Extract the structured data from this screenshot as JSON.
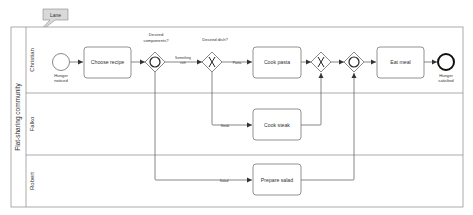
{
  "callout": {
    "label": "Lane"
  },
  "pool": {
    "label": "Flat-sharing community",
    "lanes": [
      {
        "label": "Christian"
      },
      {
        "label": "Falko"
      },
      {
        "label": "Robert"
      }
    ]
  },
  "events": {
    "start": {
      "label_line1": "Hunger",
      "label_line2": "noticed"
    },
    "end": {
      "label_line1": "Hunger",
      "label_line2": "satisfied"
    }
  },
  "tasks": {
    "choose_recipe": "Choose recipe",
    "cook_pasta": "Cook pasta",
    "cook_steak": "Cook steak",
    "prepare_salad": "Prepare salad",
    "eat_meal": "Eat meal"
  },
  "gateways": {
    "desired_components": {
      "type": "inclusive",
      "label_line1": "Desired",
      "label_line2": "components?"
    },
    "desired_dish": {
      "type": "exclusive",
      "label": "Desired dish?"
    },
    "dish_merge": {
      "type": "exclusive"
    },
    "components_merge": {
      "type": "inclusive"
    }
  },
  "flow_labels": {
    "something_line1": "Something",
    "something_line2": "rich",
    "pasta": "Pasta",
    "steak": "Steak",
    "salad": "Salad"
  },
  "colors": {
    "stroke": "#555555",
    "callout_fill": "#d9d9d9",
    "background": "#ffffff"
  }
}
